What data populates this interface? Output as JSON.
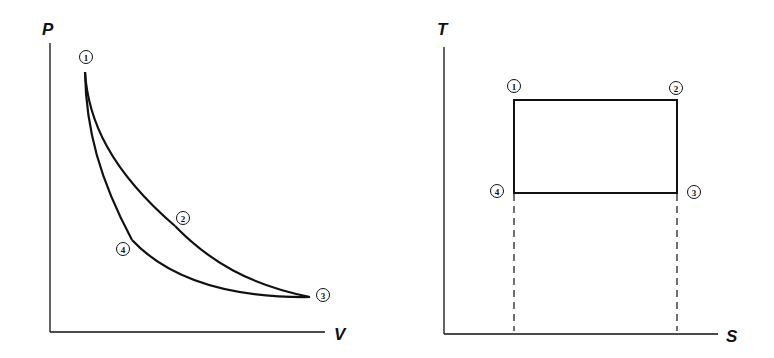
{
  "diagrams": [
    {
      "name": "pv-diagram",
      "x_axis_label": "V",
      "y_axis_label": "P",
      "points": [
        {
          "id": "1",
          "label": "1"
        },
        {
          "id": "2",
          "label": "2"
        },
        {
          "id": "3",
          "label": "3"
        },
        {
          "id": "4",
          "label": "4"
        }
      ],
      "processes": [
        {
          "from": "1",
          "to": "2",
          "shape": "curve"
        },
        {
          "from": "2",
          "to": "3",
          "shape": "curve"
        },
        {
          "from": "3",
          "to": "4",
          "shape": "curve"
        },
        {
          "from": "4",
          "to": "1",
          "shape": "curve"
        }
      ]
    },
    {
      "name": "ts-diagram",
      "x_axis_label": "S",
      "y_axis_label": "T",
      "points": [
        {
          "id": "1",
          "label": "1"
        },
        {
          "id": "2",
          "label": "2"
        },
        {
          "id": "3",
          "label": "3"
        },
        {
          "id": "4",
          "label": "4"
        }
      ],
      "processes": [
        {
          "from": "1",
          "to": "2",
          "shape": "horizontal line (isothermal)"
        },
        {
          "from": "2",
          "to": "3",
          "shape": "vertical line (isentropic)"
        },
        {
          "from": "3",
          "to": "4",
          "shape": "horizontal line (isothermal)"
        },
        {
          "from": "4",
          "to": "1",
          "shape": "vertical line (isentropic)"
        }
      ],
      "projection_lines": "dashed verticals from points 4 and 3 to S axis"
    }
  ],
  "stroke_color": "#111111",
  "background_color": "#ffffff"
}
